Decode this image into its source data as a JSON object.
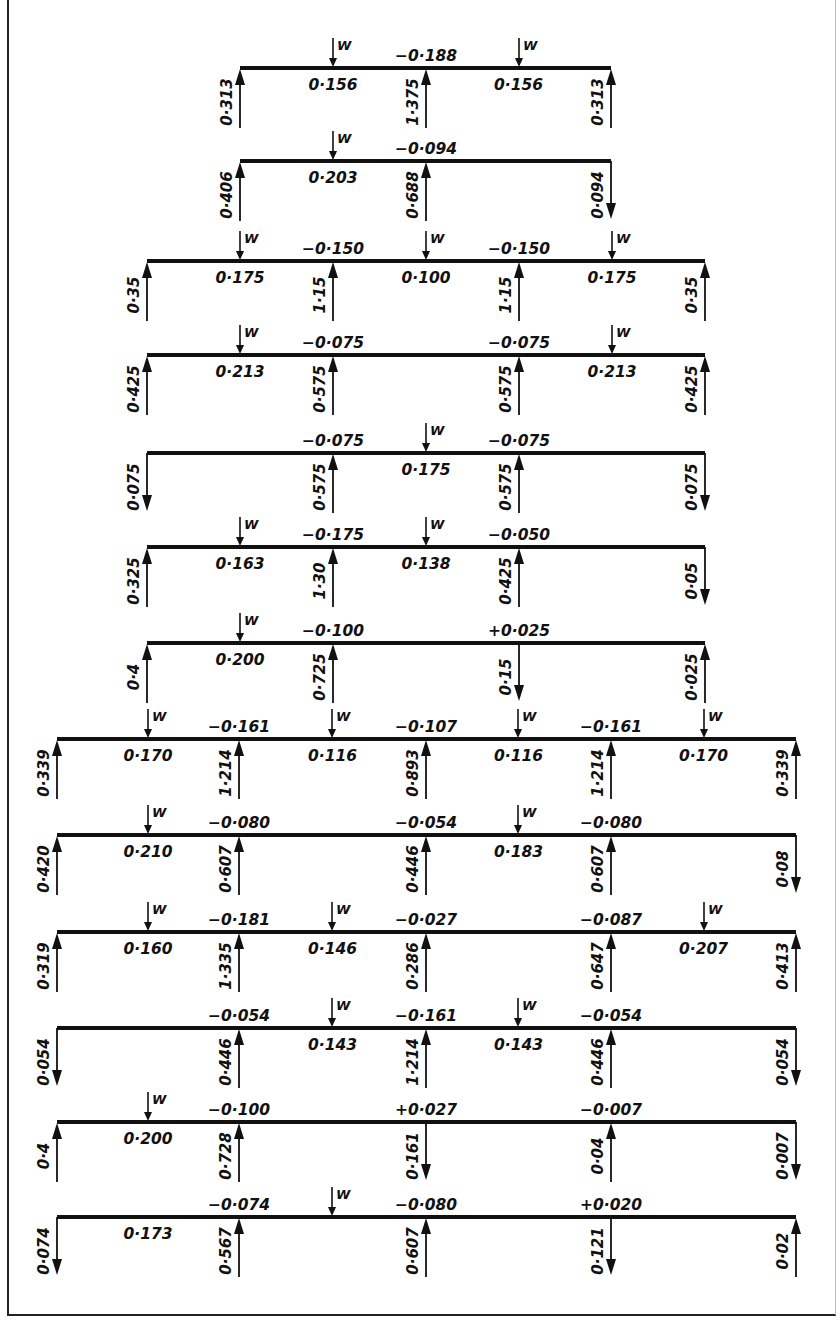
{
  "figure": {
    "load_symbol": "W",
    "colors": {
      "ink": "#111111",
      "background": "#ffffff"
    }
  },
  "layouts": {
    "two_span": {
      "supports_x": [
        240,
        426,
        611
      ]
    },
    "three_span": {
      "supports_x": [
        147,
        333,
        519,
        705
      ]
    },
    "four_span": {
      "supports_x": [
        57,
        239,
        426,
        611,
        796
      ]
    }
  },
  "cases": [
    {
      "id": 1,
      "layout": "two_span",
      "beam_y": 68,
      "loads_x": [
        333,
        519
      ],
      "span_moments": [
        "0·156",
        "0·156"
      ],
      "support_moments": [
        "-0·188"
      ],
      "reactions": [
        {
          "value": "0·313",
          "dir": "up"
        },
        {
          "value": "1·375",
          "dir": "up"
        },
        {
          "value": "0·313",
          "dir": "up"
        }
      ]
    },
    {
      "id": 2,
      "layout": "two_span",
      "beam_y": 161,
      "loads_x": [
        333
      ],
      "span_moments": [
        "0·203",
        ""
      ],
      "support_moments": [
        "-0·094"
      ],
      "reactions": [
        {
          "value": "0·406",
          "dir": "up"
        },
        {
          "value": "0·688",
          "dir": "up"
        },
        {
          "value": "0·094",
          "dir": "down"
        }
      ]
    },
    {
      "id": 3,
      "layout": "three_span",
      "beam_y": 261,
      "loads_x": [
        240,
        426,
        612
      ],
      "span_moments": [
        "0·175",
        "0·100",
        "0·175"
      ],
      "support_moments": [
        "-0·150",
        "-0·150"
      ],
      "reactions": [
        {
          "value": "0·35",
          "dir": "up"
        },
        {
          "value": "1·15",
          "dir": "up"
        },
        {
          "value": "1·15",
          "dir": "up"
        },
        {
          "value": "0·35",
          "dir": "up"
        }
      ]
    },
    {
      "id": 4,
      "layout": "three_span",
      "beam_y": 355,
      "loads_x": [
        240,
        612
      ],
      "span_moments": [
        "0·213",
        "",
        "0·213"
      ],
      "support_moments": [
        "-0·075",
        "-0·075"
      ],
      "reactions": [
        {
          "value": "0·425",
          "dir": "up"
        },
        {
          "value": "0·575",
          "dir": "up"
        },
        {
          "value": "0·575",
          "dir": "up"
        },
        {
          "value": "0·425",
          "dir": "up"
        }
      ]
    },
    {
      "id": 5,
      "layout": "three_span",
      "beam_y": 453,
      "loads_x": [
        426
      ],
      "span_moments": [
        "",
        "0·175",
        ""
      ],
      "support_moments": [
        "-0·075",
        "-0·075"
      ],
      "reactions": [
        {
          "value": "0·075",
          "dir": "down"
        },
        {
          "value": "0·575",
          "dir": "up"
        },
        {
          "value": "0·575",
          "dir": "up"
        },
        {
          "value": "0·075",
          "dir": "down"
        }
      ]
    },
    {
      "id": 6,
      "layout": "three_span",
      "beam_y": 547,
      "loads_x": [
        240,
        426
      ],
      "span_moments": [
        "0·163",
        "0·138",
        ""
      ],
      "support_moments": [
        "-0·175",
        "-0·050"
      ],
      "reactions": [
        {
          "value": "0·325",
          "dir": "up"
        },
        {
          "value": "1·30",
          "dir": "up"
        },
        {
          "value": "0·425",
          "dir": "up"
        },
        {
          "value": "0·05",
          "dir": "down"
        }
      ]
    },
    {
      "id": 7,
      "layout": "three_span",
      "beam_y": 643,
      "loads_x": [
        240
      ],
      "span_moments": [
        "0·200",
        "",
        ""
      ],
      "support_moments": [
        "-0·100",
        "+0·025"
      ],
      "reactions": [
        {
          "value": "0·4",
          "dir": "up"
        },
        {
          "value": "0·725",
          "dir": "up"
        },
        {
          "value": "0·15",
          "dir": "down"
        },
        {
          "value": "0·025",
          "dir": "up"
        }
      ]
    },
    {
      "id": 8,
      "layout": "four_span",
      "beam_y": 739,
      "loads_x": [
        148,
        332,
        518,
        704
      ],
      "span_moments": [
        "0·170",
        "0·116",
        "0·116",
        "0·170"
      ],
      "support_moments": [
        "-0·161",
        "-0·107",
        "-0·161"
      ],
      "reactions": [
        {
          "value": "0·339",
          "dir": "up"
        },
        {
          "value": "1·214",
          "dir": "up"
        },
        {
          "value": "0·893",
          "dir": "up"
        },
        {
          "value": "1·214",
          "dir": "up"
        },
        {
          "value": "0·339",
          "dir": "up"
        }
      ]
    },
    {
      "id": 9,
      "layout": "four_span",
      "beam_y": 835,
      "loads_x": [
        148,
        518
      ],
      "span_moments": [
        "0·210",
        "",
        "0·183",
        ""
      ],
      "support_moments": [
        "-0·080",
        "-0·054",
        "-0·080"
      ],
      "reactions": [
        {
          "value": "0·420",
          "dir": "up"
        },
        {
          "value": "0·607",
          "dir": "up"
        },
        {
          "value": "0·446",
          "dir": "up"
        },
        {
          "value": "0·607",
          "dir": "up"
        },
        {
          "value": "0·08",
          "dir": "down"
        }
      ]
    },
    {
      "id": 10,
      "layout": "four_span",
      "beam_y": 932,
      "loads_x": [
        148,
        332,
        704
      ],
      "span_moments": [
        "0·160",
        "0·146",
        "",
        "0·207"
      ],
      "support_moments": [
        "-0·181",
        "-0·027",
        "-0·087"
      ],
      "reactions": [
        {
          "value": "0·319",
          "dir": "up"
        },
        {
          "value": "1·335",
          "dir": "up"
        },
        {
          "value": "0·286",
          "dir": "up"
        },
        {
          "value": "0·647",
          "dir": "up"
        },
        {
          "value": "0·413",
          "dir": "up"
        }
      ]
    },
    {
      "id": 11,
      "layout": "four_span",
      "beam_y": 1028,
      "loads_x": [
        332,
        518
      ],
      "span_moments": [
        "",
        "0·143",
        "0·143",
        ""
      ],
      "support_moments": [
        "-0·054",
        "-0·161",
        "-0·054"
      ],
      "reactions": [
        {
          "value": "0·054",
          "dir": "down"
        },
        {
          "value": "0·446",
          "dir": "up"
        },
        {
          "value": "1·214",
          "dir": "up"
        },
        {
          "value": "0·446",
          "dir": "up"
        },
        {
          "value": "0·054",
          "dir": "down"
        }
      ]
    },
    {
      "id": 12,
      "layout": "four_span",
      "beam_y": 1122,
      "loads_x": [
        148
      ],
      "span_moments": [
        "0·200",
        "",
        "",
        ""
      ],
      "support_moments": [
        "-0·100",
        "+0·027",
        "-0·007"
      ],
      "reactions": [
        {
          "value": "0·4",
          "dir": "up"
        },
        {
          "value": "0·728",
          "dir": "up"
        },
        {
          "value": "0·161",
          "dir": "down"
        },
        {
          "value": "0·04",
          "dir": "up"
        },
        {
          "value": "0·007",
          "dir": "down"
        }
      ]
    },
    {
      "id": 13,
      "layout": "four_span",
      "beam_y": 1217,
      "loads_x": [
        332
      ],
      "span_moments": [
        "0·173",
        "",
        "",
        ""
      ],
      "support_moments": [
        "-0·074",
        "-0·080",
        "+0·020"
      ],
      "reactions": [
        {
          "value": "0·074",
          "dir": "down"
        },
        {
          "value": "0·567",
          "dir": "up"
        },
        {
          "value": "0·607",
          "dir": "up"
        },
        {
          "value": "0·121",
          "dir": "down"
        },
        {
          "value": "0·02",
          "dir": "up"
        }
      ]
    }
  ]
}
